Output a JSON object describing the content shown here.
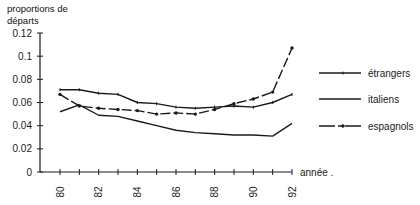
{
  "chart_data": {
    "type": "line",
    "title": "",
    "xlabel": "année",
    "ylabel": "proportions de départs",
    "ylabel_lines": [
      "proportions de",
      "départs"
    ],
    "x": [
      80,
      81,
      82,
      83,
      84,
      85,
      86,
      87,
      88,
      89,
      90,
      91,
      92
    ],
    "x_tick_labels": [
      "80",
      "82",
      "84",
      "86",
      "88",
      "90",
      "92"
    ],
    "y_tick_labels": [
      "0",
      "0.02",
      "0.04",
      "0.06",
      "0.08",
      "0.1",
      "0.12"
    ],
    "y_ticks": [
      0,
      0.02,
      0.04,
      0.06,
      0.08,
      0.1,
      0.12
    ],
    "ylim": [
      0,
      0.12
    ],
    "xlim": [
      80,
      92
    ],
    "grid": false,
    "legend_position": "right",
    "series": [
      {
        "name": "étrangers",
        "marker": "tick",
        "values": [
          0.071,
          0.071,
          0.068,
          0.067,
          0.06,
          0.059,
          0.056,
          0.055,
          0.056,
          0.057,
          0.056,
          0.06,
          0.067
        ]
      },
      {
        "name": "italiens",
        "marker": "none",
        "values": [
          0.052,
          0.058,
          0.049,
          0.048,
          0.044,
          0.04,
          0.036,
          0.034,
          0.033,
          0.032,
          0.032,
          0.031,
          0.042
        ]
      },
      {
        "name": "espagnols",
        "marker": "dot",
        "dashed": true,
        "values": [
          0.067,
          0.057,
          0.055,
          0.054,
          0.053,
          0.05,
          0.051,
          0.05,
          0.054,
          0.059,
          0.063,
          0.069,
          0.107
        ]
      }
    ]
  }
}
